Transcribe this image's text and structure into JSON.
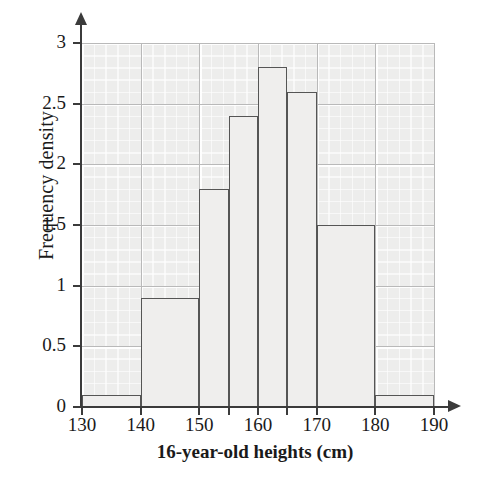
{
  "chart_data": {
    "type": "bar",
    "title": "",
    "xlabel": "16-year-old heights (cm)",
    "ylabel": "Frequency density",
    "xlim": [
      130,
      190
    ],
    "ylim": [
      0,
      3
    ],
    "grid": true,
    "legend": "none",
    "xticks": [
      130,
      140,
      150,
      160,
      170,
      180,
      190
    ],
    "xtick_labels": [
      "130",
      "140",
      "150",
      "160",
      "170",
      "180",
      "190"
    ],
    "yticks": [
      0,
      0.5,
      1,
      1.5,
      2,
      2.5,
      3
    ],
    "ytick_labels": [
      "0",
      "0.5",
      "1",
      "1.5",
      "2",
      "2.5",
      "3"
    ],
    "bin_edges": [
      130,
      140,
      150,
      155,
      160,
      165,
      170,
      180,
      190
    ],
    "categories": [
      "130-140",
      "140-150",
      "150-155",
      "155-160",
      "160-165",
      "165-170",
      "170-180",
      "180-190"
    ],
    "values": [
      0.1,
      0.9,
      1.8,
      2.4,
      2.8,
      2.6,
      1.5,
      0.1
    ],
    "bars": [
      {
        "label": "130-140",
        "x0": 130,
        "x1": 140,
        "value": 0.1
      },
      {
        "label": "140-150",
        "x0": 140,
        "x1": 150,
        "value": 0.9
      },
      {
        "label": "150-155",
        "x0": 150,
        "x1": 155,
        "value": 1.8
      },
      {
        "label": "155-160",
        "x0": 155,
        "x1": 160,
        "value": 2.4
      },
      {
        "label": "160-165",
        "x0": 160,
        "x1": 165,
        "value": 2.8
      },
      {
        "label": "165-170",
        "x0": 165,
        "x1": 170,
        "value": 2.6
      },
      {
        "label": "170-180",
        "x0": 170,
        "x1": 180,
        "value": 1.5
      },
      {
        "label": "180-190",
        "x0": 180,
        "x1": 190,
        "value": 0.1
      }
    ],
    "colors": {
      "bar_fill": "#efeeed",
      "bar_edge": "#555555",
      "plot_background": "#ededec",
      "gridline": "#b9b9b9",
      "axis": "#3b3b3b",
      "text": "#1a1a1a"
    }
  }
}
